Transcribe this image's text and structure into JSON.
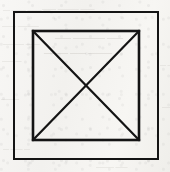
{
  "canvas": {
    "width": 170,
    "height": 172,
    "background_color": "#f5f4f2",
    "paper_tone": "#f6f5f3",
    "medium": "scanned paper"
  },
  "figure": {
    "ink_color": "#141414",
    "outer_square": {
      "name": "outer-square",
      "x": 14,
      "y": 12,
      "width": 144,
      "height": 147,
      "stroke_width": 2,
      "fill": "none"
    },
    "inner_square": {
      "name": "inner-square",
      "x": 33,
      "y": 31,
      "width": 106,
      "height": 109,
      "stroke_width": 2.6,
      "fill": "none"
    },
    "diagonals": [
      {
        "name": "diagonal-top-left-to-bottom-right",
        "x1": 33,
        "y1": 31,
        "x2": 139,
        "y2": 140,
        "stroke_width": 2.2
      },
      {
        "name": "diagonal-top-right-to-bottom-left",
        "x1": 139,
        "y1": 31,
        "x2": 33,
        "y2": 140,
        "stroke_width": 2.2
      }
    ],
    "intersection_point": {
      "x": 86,
      "y": 85.5
    }
  },
  "bleed_through": {
    "description": "Illegible mirrored ghost text showing through from the reverse side of the scanned sheet",
    "color": "#9a958e",
    "marks": [
      {
        "text": "— —— —— —",
        "x": 3,
        "y": 6,
        "size": 7
      },
      {
        "text": "—— ——— ——",
        "x": 42,
        "y": 5,
        "size": 7
      },
      {
        "text": "——— ——",
        "x": 2,
        "y": 22,
        "size": 7
      },
      {
        "text": "—— ———— ——",
        "x": 55,
        "y": 33,
        "size": 8
      },
      {
        "text": "—— ———",
        "x": 3,
        "y": 40,
        "size": 7
      },
      {
        "text": "——— —— ———",
        "x": 44,
        "y": 48,
        "size": 8
      },
      {
        "text": "— ——",
        "x": 2,
        "y": 58,
        "size": 6
      },
      {
        "text": "—— —",
        "x": 160,
        "y": 62,
        "size": 6
      },
      {
        "text": "———",
        "x": 1,
        "y": 96,
        "size": 6
      },
      {
        "text": "——",
        "x": 162,
        "y": 104,
        "size": 6
      },
      {
        "text": "— —— —",
        "x": 3,
        "y": 146,
        "size": 6
      },
      {
        "text": "—— ———",
        "x": 96,
        "y": 164,
        "size": 6
      }
    ]
  }
}
